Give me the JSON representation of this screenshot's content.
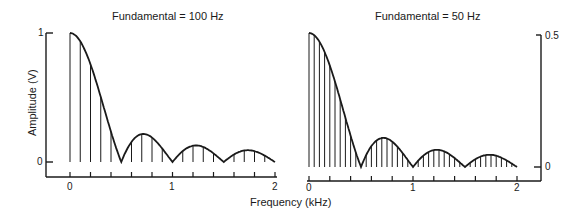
{
  "figure": {
    "xlabel": "Frequency (kHz)",
    "ylabel": "Amplitude (V)"
  },
  "chart_data": [
    {
      "type": "bar",
      "title": "Fundamental = 100 Hz",
      "xlabel": "Frequency (kHz)",
      "ylabel": "Amplitude (V)",
      "xlim": [
        0,
        2
      ],
      "ylim": [
        0,
        1
      ],
      "x_ticks": [
        "0",
        "1",
        "2"
      ],
      "y_ticks": [
        "0",
        "1"
      ],
      "envelope": "|sinc| with nulls at 0.5, 1.0, 1.5 kHz",
      "fundamental_hz": 100,
      "x": [
        0.0,
        0.1,
        0.2,
        0.3,
        0.4,
        0.5,
        0.6,
        0.7,
        0.8,
        0.9,
        1.0,
        1.1,
        1.2,
        1.3,
        1.4,
        1.5,
        1.6,
        1.7,
        1.8,
        1.9,
        2.0
      ],
      "values": [
        1.0,
        0.94,
        0.76,
        0.5,
        0.23,
        0.0,
        0.16,
        0.21,
        0.19,
        0.1,
        0.0,
        0.09,
        0.13,
        0.11,
        0.06,
        0.0,
        0.06,
        0.09,
        0.08,
        0.05,
        0.0
      ],
      "grid": false
    },
    {
      "type": "bar",
      "title": "Fundamental = 50 Hz",
      "xlabel": "Frequency (kHz)",
      "ylabel": "Amplitude (V)",
      "xlim": [
        0,
        2
      ],
      "ylim": [
        0,
        0.5
      ],
      "x_ticks": [
        "0",
        "1",
        "2"
      ],
      "y_ticks": [
        "0",
        "0.5"
      ],
      "envelope": "|sinc| with nulls at 0.5, 1.0, 1.5 kHz",
      "fundamental_hz": 50,
      "x": [
        0.0,
        0.05,
        0.1,
        0.15,
        0.2,
        0.25,
        0.3,
        0.35,
        0.4,
        0.45,
        0.5,
        0.55,
        0.6,
        0.65,
        0.7,
        0.75,
        0.8,
        0.85,
        0.9,
        0.95,
        1.0,
        1.05,
        1.1,
        1.15,
        1.2,
        1.25,
        1.3,
        1.35,
        1.4,
        1.45,
        1.5,
        1.55,
        1.6,
        1.65,
        1.7,
        1.75,
        1.8,
        1.85,
        1.9,
        1.95,
        2.0
      ],
      "values": [
        0.5,
        0.49,
        0.47,
        0.43,
        0.38,
        0.32,
        0.25,
        0.18,
        0.12,
        0.05,
        0.0,
        0.04,
        0.08,
        0.1,
        0.11,
        0.11,
        0.09,
        0.07,
        0.05,
        0.03,
        0.0,
        0.02,
        0.05,
        0.06,
        0.06,
        0.06,
        0.05,
        0.04,
        0.03,
        0.01,
        0.0,
        0.02,
        0.03,
        0.04,
        0.05,
        0.05,
        0.04,
        0.03,
        0.02,
        0.01,
        0.0
      ],
      "grid": false
    }
  ]
}
